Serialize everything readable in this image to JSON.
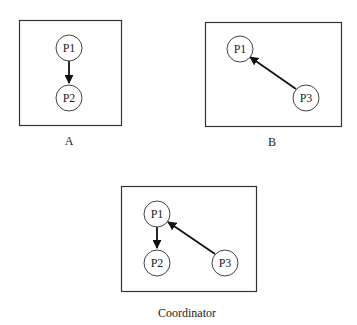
{
  "diagrams": {
    "A": {
      "caption": "A",
      "nodes": {
        "p1": "P1",
        "p2": "P2"
      },
      "edges": [
        {
          "from": "P1",
          "to": "P2"
        }
      ]
    },
    "B": {
      "caption": "B",
      "nodes": {
        "p1": "P1",
        "p3": "P3"
      },
      "edges": [
        {
          "from": "P3",
          "to": "P1"
        }
      ]
    },
    "coordinator": {
      "caption": "Coordinator",
      "nodes": {
        "p1": "P1",
        "p2": "P2",
        "p3": "P3"
      },
      "edges": [
        {
          "from": "P1",
          "to": "P2"
        },
        {
          "from": "P3",
          "to": "P1"
        }
      ]
    }
  },
  "colors": {
    "stroke": "#333333",
    "text": "#222222",
    "background": "#ffffff"
  }
}
